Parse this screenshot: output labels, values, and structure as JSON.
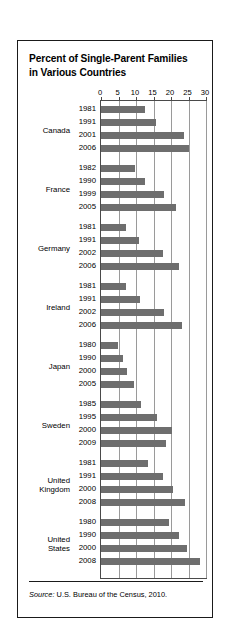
{
  "figure": {
    "title": "Percent of Single-Parent Families in Various Countries",
    "title_line1": "Percent of Single-Parent Families",
    "title_line2": "in Various Countries",
    "source_prefix": "Source:",
    "source_text": "U.S. Bureau of the Census, 2010.",
    "bar_color": "#6e6e6e",
    "grid_color": "#9a9a9a",
    "frame_color": "#1a1a1a"
  },
  "chart_data": {
    "type": "bar",
    "orientation": "horizontal",
    "title": "Percent of Single-Parent Families in Various Countries",
    "xlabel": "",
    "ylabel": "",
    "xlim": [
      0,
      30
    ],
    "xticks": [
      0,
      5,
      10,
      15,
      20,
      25,
      30
    ],
    "xtick_labels": [
      "0",
      "5",
      "10",
      "15",
      "20",
      "25",
      "30"
    ],
    "grid": true,
    "legend": "none",
    "source": "Source: U.S. Bureau of the Census, 2010.",
    "groups": [
      {
        "country": "Canada",
        "country_lines": [
          "Canada"
        ],
        "points": [
          {
            "year": "1981",
            "value": 12.7
          },
          {
            "year": "1991",
            "value": 15.6
          },
          {
            "year": "2001",
            "value": 23.7
          },
          {
            "year": "2006",
            "value": 25.0
          }
        ]
      },
      {
        "country": "France",
        "country_lines": [
          "France"
        ],
        "points": [
          {
            "year": "1982",
            "value": 9.8
          },
          {
            "year": "1990",
            "value": 12.7
          },
          {
            "year": "1999",
            "value": 18.0
          },
          {
            "year": "2005",
            "value": 21.3
          }
        ]
      },
      {
        "country": "Germany",
        "country_lines": [
          "Germany"
        ],
        "points": [
          {
            "year": "1981",
            "value": 7.1
          },
          {
            "year": "1991",
            "value": 10.8
          },
          {
            "year": "2002",
            "value": 17.6
          },
          {
            "year": "2006",
            "value": 22.4
          }
        ]
      },
      {
        "country": "Ireland",
        "country_lines": [
          "Ireland"
        ],
        "points": [
          {
            "year": "1981",
            "value": 7.1
          },
          {
            "year": "1991",
            "value": 11.0
          },
          {
            "year": "2002",
            "value": 17.9
          },
          {
            "year": "2006",
            "value": 23.1
          }
        ]
      },
      {
        "country": "Japan",
        "country_lines": [
          "Japan"
        ],
        "points": [
          {
            "year": "1980",
            "value": 4.9
          },
          {
            "year": "1990",
            "value": 6.4
          },
          {
            "year": "2000",
            "value": 7.3
          },
          {
            "year": "2005",
            "value": 9.4
          }
        ]
      },
      {
        "country": "Sweden",
        "country_lines": [
          "Sweden"
        ],
        "points": [
          {
            "year": "1985",
            "value": 11.4
          },
          {
            "year": "1995",
            "value": 16.0
          },
          {
            "year": "2000",
            "value": 20.3
          },
          {
            "year": "2009",
            "value": 18.7
          }
        ]
      },
      {
        "country": "United Kingdom",
        "country_lines": [
          "United",
          "Kingdom"
        ],
        "points": [
          {
            "year": "1981",
            "value": 13.4
          },
          {
            "year": "1991",
            "value": 17.8
          },
          {
            "year": "2000",
            "value": 20.5
          },
          {
            "year": "2008",
            "value": 23.9
          }
        ]
      },
      {
        "country": "United States",
        "country_lines": [
          "United",
          "States"
        ],
        "points": [
          {
            "year": "1980",
            "value": 19.5
          },
          {
            "year": "1990",
            "value": 22.3
          },
          {
            "year": "2000",
            "value": 24.6
          },
          {
            "year": "2008",
            "value": 28.3
          }
        ]
      }
    ]
  }
}
